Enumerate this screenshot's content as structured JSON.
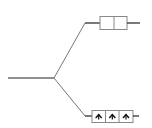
{
  "diagram": {
    "type": "branching-connector",
    "colors": {
      "stroke": "#222222",
      "branch": "#777777",
      "box": "#888888",
      "glyph": "#111111"
    },
    "trunk": {
      "x1": 8,
      "y1": 78,
      "x2": 53,
      "y2": 78
    },
    "upper": {
      "box_cells": 2,
      "cell_glyphs": [
        "",
        ""
      ]
    },
    "lower": {
      "box_cells": 3,
      "cell_glyphs": [
        "arrow-up",
        "arrow-up",
        "arrow-up"
      ]
    }
  }
}
